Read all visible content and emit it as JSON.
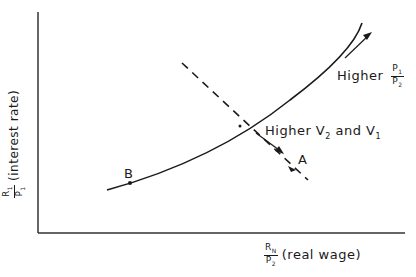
{
  "diagram": {
    "y_axis_label": {
      "num": "R",
      "num_sub": "1",
      "den": "P",
      "den_sub": "1",
      "text": "(interest rate)"
    },
    "x_axis_label": {
      "num": "R",
      "num_sub": "N",
      "den": "P",
      "den_sub": "2",
      "text": "(real wage)"
    },
    "annotations": {
      "higher_p": {
        "text": "Higher",
        "num": "P",
        "num_sub": "1",
        "den": "P",
        "den_sub": "2"
      },
      "higher_v": {
        "text": "Higher V",
        "sub1": "2",
        "mid": " and V",
        "sub2": "1"
      }
    },
    "points": {
      "a": "A",
      "b": "B"
    },
    "colors": {
      "line": "#1a1a1a",
      "background": "#ffffff"
    }
  }
}
